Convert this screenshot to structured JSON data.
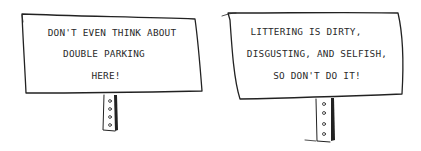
{
  "scene": {
    "description": "Two hand-drawn signs on posts",
    "background": "#ffffff",
    "ink": "#222222"
  },
  "signs": [
    {
      "id": "left",
      "lines": [
        "DON'T EVEN THINK ABOUT",
        "DOUBLE PARKING",
        "HERE!"
      ]
    },
    {
      "id": "right",
      "lines": [
        "LITTERING IS DIRTY,",
        "DISGUSTING, AND SELFISH,",
        "SO DON'T DO IT!"
      ]
    }
  ]
}
